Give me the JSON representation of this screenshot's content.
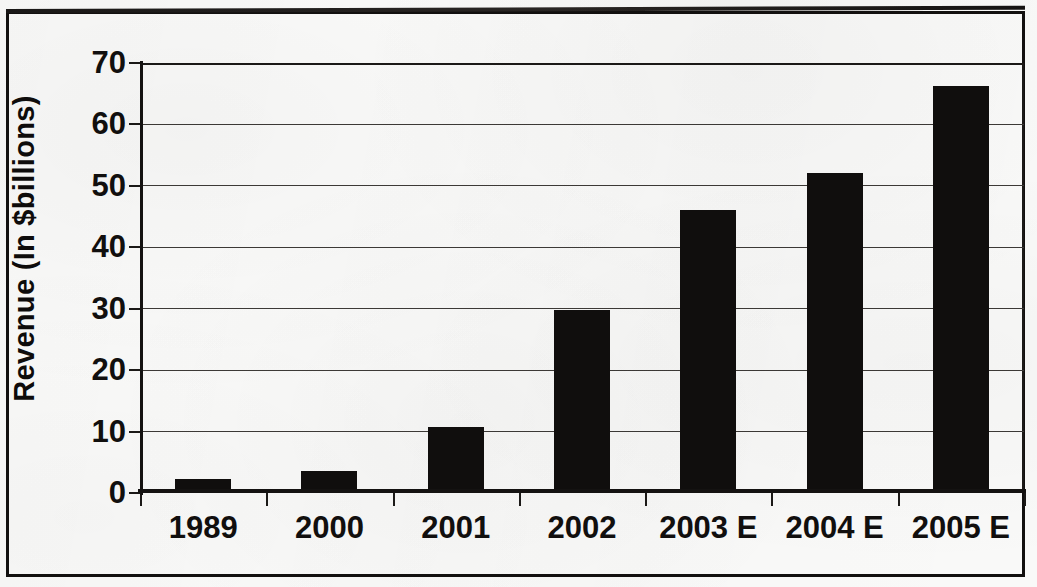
{
  "chart_data": {
    "type": "bar",
    "title": "",
    "subtitle": "",
    "xlabel": "",
    "ylabel": "Revenue (In $billions)",
    "categories": [
      "1989",
      "2000",
      "2001",
      "2002",
      "2003 E",
      "2004 E",
      "2005 E"
    ],
    "values": [
      2.0,
      3.3,
      10.4,
      29.4,
      45.7,
      51.8,
      66.0
    ],
    "series": [
      {
        "name": "Revenue",
        "values": [
          2.0,
          3.3,
          10.4,
          29.4,
          45.7,
          51.8,
          66.0
        ]
      }
    ],
    "ylim": [
      0,
      70
    ],
    "yticks": [
      0,
      10,
      20,
      30,
      40,
      50,
      60,
      70
    ],
    "ytick_labels": [
      "0",
      "10",
      "20",
      "30",
      "40",
      "50",
      "60",
      "70"
    ],
    "grid": true,
    "grid_axis": "y",
    "legend": false,
    "legend_position": "none",
    "bar_color": "#100e0d",
    "plot_background": "#ffffff",
    "axis_color": "#141211",
    "gridline_color": "#3d3a37",
    "annotations": []
  },
  "figure": {
    "border_color": "#12100f",
    "page_background": "#fbfbfa"
  }
}
